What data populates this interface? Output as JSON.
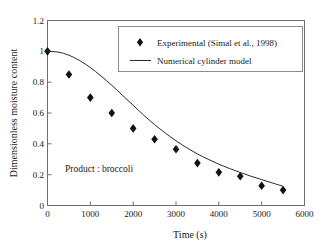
{
  "chart_data": {
    "type": "scatter",
    "title": "",
    "xlabel": "Time (s)",
    "ylabel": "Dimensionless moisture content",
    "xlim": [
      0,
      6000
    ],
    "ylim": [
      0,
      1.2
    ],
    "xticks": [
      0,
      1000,
      2000,
      3000,
      4000,
      5000,
      6000
    ],
    "yticks": [
      0,
      0.2,
      0.4,
      0.6,
      0.8,
      1,
      1.2
    ],
    "xtick_labels": [
      "0",
      "1000",
      "2000",
      "3000",
      "4000",
      "5000",
      "6000"
    ],
    "ytick_labels": [
      "0",
      "0.2",
      "0.4",
      "0.6",
      "0.8",
      "1",
      "1.2"
    ],
    "grid": false,
    "legend_position": "top-right",
    "annotation": "Product : broccoli",
    "series": [
      {
        "name": "Experimental (Simal et al., 1998)",
        "type": "scatter",
        "marker": "diamond",
        "color": "#111111",
        "x": [
          0,
          500,
          1000,
          1500,
          2000,
          2500,
          3000,
          3500,
          4000,
          4500,
          5000,
          5500
        ],
        "values": [
          1.0,
          0.85,
          0.7,
          0.6,
          0.5,
          0.43,
          0.365,
          0.275,
          0.215,
          0.19,
          0.128,
          0.1
        ]
      },
      {
        "name": "Numerical cylinder model",
        "type": "line",
        "color": "#2b2b2b",
        "x": [
          0,
          250,
          500,
          750,
          1000,
          1250,
          1500,
          1750,
          2000,
          2250,
          2500,
          2750,
          3000,
          3250,
          3500,
          3750,
          4000,
          4250,
          4500,
          4750,
          5000,
          5250,
          5500
        ],
        "values": [
          1.0,
          0.995,
          0.975,
          0.94,
          0.895,
          0.84,
          0.78,
          0.715,
          0.65,
          0.585,
          0.525,
          0.47,
          0.42,
          0.375,
          0.335,
          0.3,
          0.268,
          0.24,
          0.214,
          0.19,
          0.168,
          0.146,
          0.125
        ]
      }
    ]
  },
  "legend": {
    "entries": [
      {
        "label": "Experimental (Simal et al., 1998)",
        "marker": "diamond"
      },
      {
        "label": "Numerical cylinder model",
        "marker": "line"
      }
    ]
  },
  "axes": {
    "x_title": "Time (s)",
    "y_title": "Dimensionless moisture content"
  },
  "annotation": {
    "text": "Product : broccoli"
  }
}
